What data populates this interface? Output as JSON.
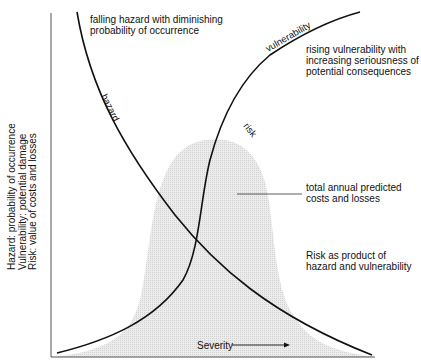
{
  "diagram": {
    "axes": {
      "y_label_lines": [
        "Hazard: probability of occurrence",
        "Vulnerability: potential damage",
        "Risk: value of costs and losses"
      ],
      "x_label": "Severity",
      "x_arrow": "right-arrow-icon"
    },
    "curves": {
      "hazard": {
        "label": "hazard",
        "trend": "falling",
        "color": "#111111"
      },
      "vulnerability": {
        "label": "vulnerability",
        "trend": "rising",
        "color": "#111111"
      },
      "risk": {
        "label": "risk",
        "shape": "bell",
        "fill": "#e4e4e4"
      }
    },
    "annotations": {
      "hazard_note": [
        "falling hazard with diminishing",
        "probability of occurrence"
      ],
      "vulnerability_note": [
        "rising vulnerability with",
        "increasing seriousness of",
        "potential consequences"
      ],
      "risk_area_note": [
        "total annual predicted",
        "costs and losses"
      ],
      "risk_product_note": [
        "Risk as product of",
        "hazard and vulnerability"
      ]
    }
  }
}
